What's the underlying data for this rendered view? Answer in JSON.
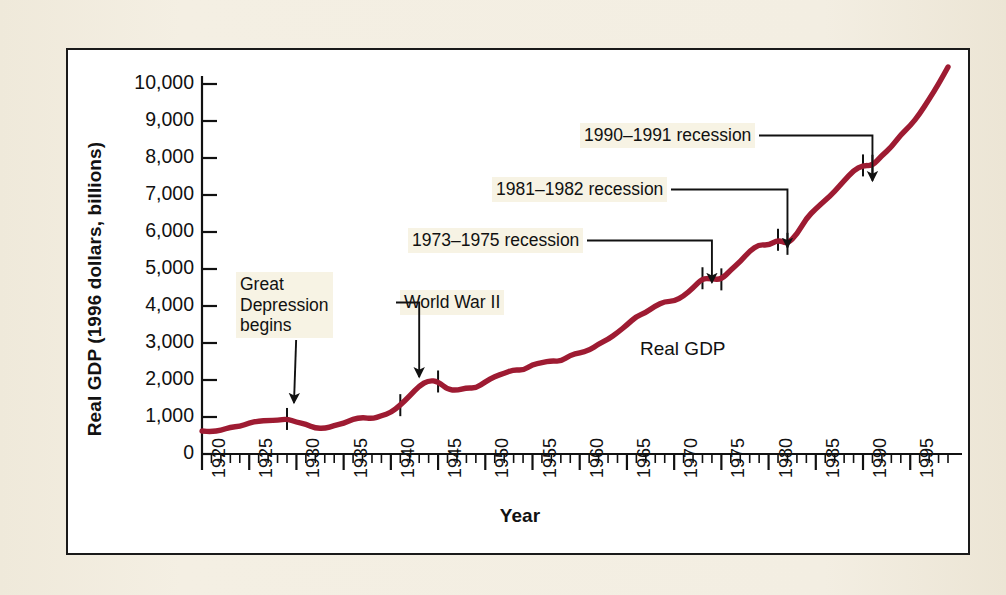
{
  "figure": {
    "background_color": "#f2ede0",
    "panel_color": "#ffffff",
    "border_color": "#1a1a1a",
    "line_color": "#9e1b32",
    "annotation_bg": "#f7f3e4"
  },
  "chart_data": {
    "type": "line",
    "title": "",
    "xlabel": "Year",
    "ylabel": "Real GDP (1996 dollars, billions)",
    "xlim": [
      1920,
      1999
    ],
    "ylim": [
      0,
      10000
    ],
    "ytick_labels": [
      "10,000",
      "9,000",
      "8,000",
      "7,000",
      "6,000",
      "5,000",
      "4,000",
      "3,000",
      "2,000",
      "1,000",
      "0"
    ],
    "ytick_values": [
      10000,
      9000,
      8000,
      7000,
      6000,
      5000,
      4000,
      3000,
      2000,
      1000,
      0
    ],
    "xtick_labels": [
      "1920",
      "1925",
      "1930",
      "1935",
      "1940",
      "1945",
      "1950",
      "1955",
      "1960",
      "1965",
      "1970",
      "1975",
      "1980",
      "1985",
      "1990",
      "1995"
    ],
    "xtick_values": [
      1920,
      1925,
      1930,
      1935,
      1940,
      1945,
      1950,
      1955,
      1960,
      1965,
      1970,
      1975,
      1980,
      1985,
      1990,
      1995
    ],
    "minor_tick_interval": 1,
    "grid": false,
    "legend": "inline",
    "series": [
      {
        "name": "Real GDP",
        "color": "#9e1b32",
        "x": [
          1920,
          1921,
          1922,
          1923,
          1924,
          1925,
          1926,
          1927,
          1928,
          1929,
          1930,
          1931,
          1932,
          1933,
          1934,
          1935,
          1936,
          1937,
          1938,
          1939,
          1940,
          1941,
          1942,
          1943,
          1944,
          1945,
          1946,
          1947,
          1948,
          1949,
          1950,
          1951,
          1952,
          1953,
          1954,
          1955,
          1956,
          1957,
          1958,
          1959,
          1960,
          1961,
          1962,
          1963,
          1964,
          1965,
          1966,
          1967,
          1968,
          1969,
          1970,
          1971,
          1972,
          1973,
          1974,
          1975,
          1976,
          1977,
          1978,
          1979,
          1980,
          1981,
          1982,
          1983,
          1984,
          1985,
          1986,
          1987,
          1988,
          1989,
          1990,
          1991,
          1992,
          1993,
          1994,
          1995,
          1996,
          1997,
          1998,
          1999
        ],
        "y": [
          620,
          604,
          640,
          725,
          747,
          838,
          893,
          903,
          912,
          947,
          861,
          805,
          700,
          690,
          765,
          833,
          942,
          990,
          952,
          1030,
          1120,
          1320,
          1570,
          1840,
          1990,
          1960,
          1740,
          1720,
          1790,
          1780,
          1950,
          2100,
          2180,
          2280,
          2260,
          2420,
          2470,
          2520,
          2500,
          2670,
          2740,
          2800,
          2970,
          3100,
          3280,
          3490,
          3720,
          3820,
          4000,
          4120,
          4130,
          4270,
          4490,
          4750,
          4730,
          4720,
          4970,
          5200,
          5490,
          5660,
          5640,
          5790,
          5680,
          5940,
          6370,
          6630,
          6860,
          7090,
          7390,
          7660,
          7800,
          7790,
          8070,
          8290,
          8630,
          8870,
          9190,
          9590,
          10000,
          10460
        ],
        "y_scale_note": "plotted values in 1996 dollars, billions"
      }
    ],
    "annotations": [
      {
        "id": "great-depression",
        "text": "Great\nDepression\nbegins",
        "target_year": 1929,
        "target_value": 900,
        "arrow": "diagonal"
      },
      {
        "id": "world-war-2",
        "text": "World War II",
        "target_year": 1943,
        "target_value": 1650,
        "arrow": "elbow-down"
      },
      {
        "id": "recession-1973-1975",
        "text": "1973–1975 recession",
        "target_year": 1974,
        "target_value": 4200,
        "arrow": "elbow-down"
      },
      {
        "id": "recession-1981-1982",
        "text": "1981–1982 recession",
        "target_year": 1982,
        "target_value": 5150,
        "arrow": "elbow-down"
      },
      {
        "id": "recession-1990-1991",
        "text": "1990–1991 recession",
        "target_year": 1991,
        "target_value": 6950,
        "arrow": "elbow-down"
      }
    ],
    "event_markers": [
      {
        "year": 1929,
        "label": "Great Depression begins"
      },
      {
        "year": 1941,
        "label": "World War II start"
      },
      {
        "year": 1945,
        "label": "World War II end"
      },
      {
        "year": 1973,
        "label": "recession start"
      },
      {
        "year": 1975,
        "label": "recession end"
      },
      {
        "year": 1981,
        "label": "recession start"
      },
      {
        "year": 1982,
        "label": "recession end"
      },
      {
        "year": 1990,
        "label": "recession start"
      },
      {
        "year": 1991,
        "label": "recession end"
      }
    ],
    "series_inline_label": "Real GDP"
  }
}
